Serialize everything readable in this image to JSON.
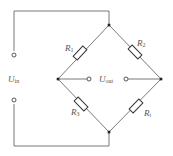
{
  "diagram": {
    "type": "wheatstone-bridge-circuit",
    "colors": {
      "wire": "#6a6a6a",
      "component": "#333333",
      "label": "#555555",
      "background": "#ffffff"
    },
    "labels": {
      "input_voltage": {
        "main": "U",
        "sub": "in"
      },
      "output_voltage": {
        "main": "U",
        "sub": "out"
      },
      "r1": {
        "main": "R",
        "sub": "1"
      },
      "r2": {
        "main": "R",
        "sub": "2"
      },
      "r3": {
        "main": "R",
        "sub": "3"
      },
      "rt": {
        "main": "R",
        "sub": "t"
      }
    },
    "components": [
      {
        "id": "R1",
        "kind": "resistor",
        "branch": "top-left"
      },
      {
        "id": "R2",
        "kind": "resistor",
        "branch": "top-right"
      },
      {
        "id": "R3",
        "kind": "resistor",
        "branch": "bottom-left"
      },
      {
        "id": "Rt",
        "kind": "resistor",
        "branch": "bottom-right"
      }
    ],
    "terminals": [
      "input-positive",
      "input-negative",
      "output-left",
      "output-right"
    ]
  }
}
